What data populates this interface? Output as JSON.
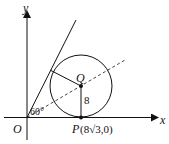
{
  "diagram": {
    "axis_x_label": "x",
    "axis_y_label": "y",
    "origin_label": "O",
    "center_label": "Q",
    "radius_label": "8",
    "angle_label": "60°",
    "point_p_label": "P",
    "point_p_coords": "(8√3,0)",
    "stroke_color": "#111111",
    "background": "#ffffff"
  }
}
